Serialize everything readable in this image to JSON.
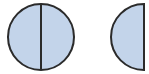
{
  "diagram": {
    "colors": {
      "fill": "#c3d4ea",
      "stroke": "#2b2b2b",
      "background": "#ffffff"
    },
    "shapes": [
      {
        "id": "full-circle",
        "type": "circle",
        "divided": true,
        "parts": 2
      },
      {
        "id": "half-circle",
        "type": "semicircle",
        "orientation": "flat-right"
      }
    ]
  }
}
